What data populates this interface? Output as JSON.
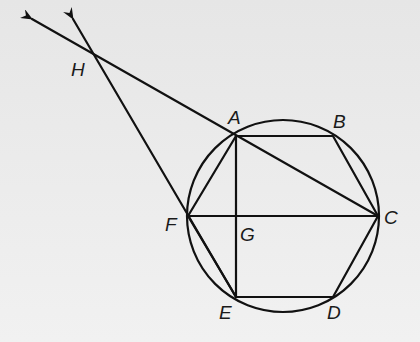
{
  "diagram": {
    "type": "geometry",
    "colors": {
      "background": "#e9e9e9",
      "stroke": "#111111",
      "label": "#1a1a1a"
    },
    "circle": {
      "cx": 283,
      "cy": 216,
      "r": 96
    },
    "points": {
      "A": {
        "label": "A",
        "x": 236,
        "y": 136
      },
      "B": {
        "label": "B",
        "x": 333,
        "y": 136
      },
      "C": {
        "label": "C",
        "x": 378,
        "y": 216
      },
      "D": {
        "label": "D",
        "x": 333,
        "y": 297
      },
      "E": {
        "label": "E",
        "x": 236,
        "y": 297
      },
      "F": {
        "label": "F",
        "x": 188,
        "y": 216
      },
      "G": {
        "label": "G",
        "x": 236,
        "y": 216
      },
      "H": {
        "label": "H",
        "x": 95,
        "y": 57
      }
    },
    "segments": [
      [
        "A",
        "B"
      ],
      [
        "B",
        "C"
      ],
      [
        "C",
        "D"
      ],
      [
        "D",
        "E"
      ],
      [
        "E",
        "F"
      ],
      [
        "F",
        "A"
      ],
      [
        "A",
        "E"
      ],
      [
        "F",
        "C"
      ],
      [
        "A",
        "C"
      ]
    ],
    "rays": [
      {
        "name": "ray-CA-through-H",
        "from": "C",
        "through": "A",
        "tip": {
          "x": 32,
          "y": 19
        }
      },
      {
        "name": "ray-EF-through-H",
        "from": "E",
        "through": "F",
        "tip": {
          "x": 73,
          "y": 19
        }
      }
    ],
    "labels": {
      "A": "A",
      "B": "B",
      "C": "C",
      "D": "D",
      "E": "E",
      "F": "F",
      "G": "G",
      "H": "H"
    }
  }
}
